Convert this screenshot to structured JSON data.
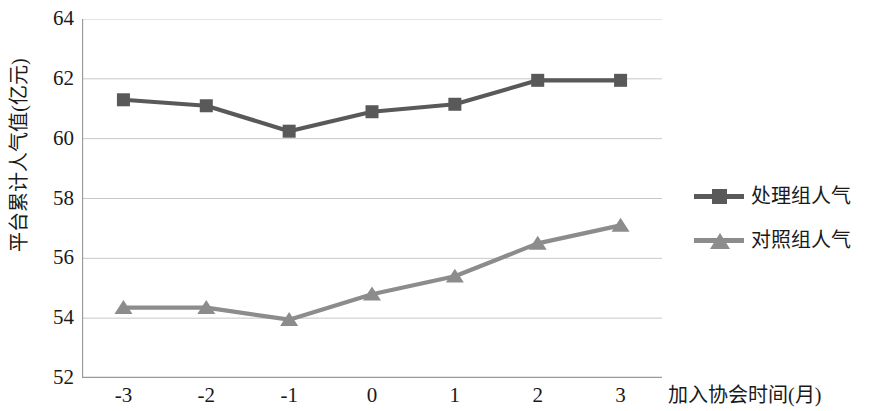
{
  "chart_data": {
    "type": "line",
    "title": "",
    "xlabel": "加入协会时间(月)",
    "ylabel": "平台累计人气值(亿元)",
    "x": [
      -3,
      -2,
      -1,
      0,
      1,
      2,
      3
    ],
    "xticklabels": [
      "-3",
      "-2",
      "-1",
      "0",
      "1",
      "2",
      "3"
    ],
    "yticklabels": [
      "52",
      "54",
      "56",
      "58",
      "60",
      "62",
      "64"
    ],
    "yticks": [
      52,
      54,
      56,
      58,
      60,
      62,
      64
    ],
    "xlim": [
      -3.5,
      3.5
    ],
    "ylim": [
      52,
      64
    ],
    "grid": true,
    "grid_axis": "y",
    "legend_position": "right",
    "series": [
      {
        "name": "处理组人气",
        "marker": "square",
        "color": "#595959",
        "values": [
          61.3,
          61.1,
          60.25,
          60.9,
          61.15,
          61.95,
          61.95
        ]
      },
      {
        "name": "对照组人气",
        "marker": "triangle",
        "color": "#8c8c8c",
        "values": [
          54.35,
          54.35,
          53.95,
          54.8,
          55.4,
          56.5,
          57.1
        ]
      }
    ]
  },
  "axes": {
    "y_title": "平台累计人气值(亿元)",
    "x_title": "加入协会时间(月)",
    "y_ticks": [
      "64",
      "62",
      "60",
      "58",
      "56",
      "54",
      "52"
    ],
    "x_ticks": [
      "-3",
      "-2",
      "-1",
      "0",
      "1",
      "2",
      "3"
    ]
  },
  "legend": {
    "items": [
      {
        "label": "处理组人气",
        "color": "#595959",
        "marker": "square-marker"
      },
      {
        "label": "对照组人气",
        "color": "#8c8c8c",
        "marker": "triangle-marker"
      }
    ]
  },
  "colors": {
    "treatment": "#595959",
    "control": "#8c8c8c",
    "axis": "#9a9a9a",
    "grid": "#c8c8c8",
    "text": "#1a1a1a"
  }
}
